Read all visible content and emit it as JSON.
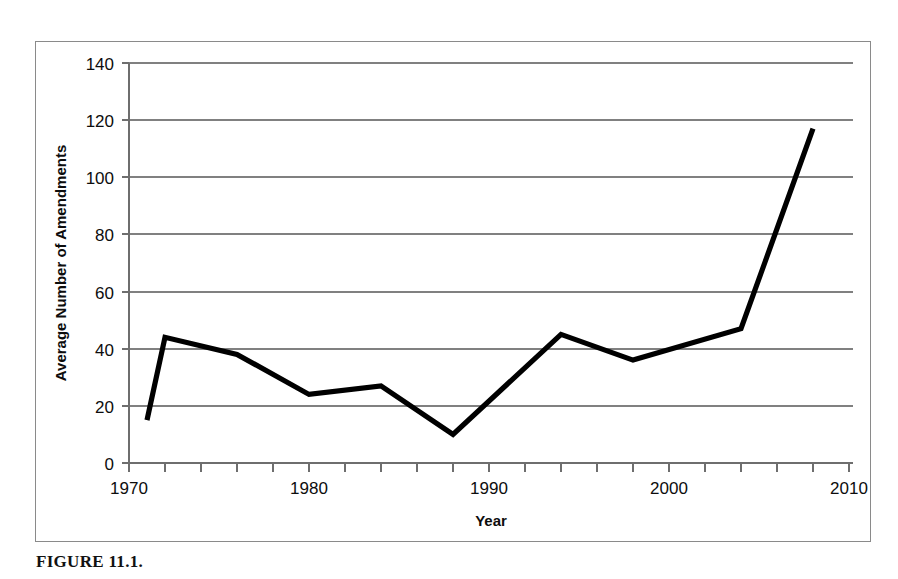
{
  "figure": {
    "caption": "FIGURE 11.1."
  },
  "chart_data": {
    "type": "line",
    "title": "",
    "xlabel": "Year",
    "ylabel": "Average Number of Amendments",
    "xlim": [
      1970,
      2010
    ],
    "ylim": [
      0,
      140
    ],
    "xticks": [
      1970,
      1980,
      1990,
      2000,
      2010
    ],
    "xtick_labels": [
      "1970",
      "1980",
      "1990",
      "2000",
      "2010"
    ],
    "xtick_minor_step": 2,
    "yticks": [
      0,
      20,
      40,
      60,
      80,
      100,
      120,
      140
    ],
    "ytick_labels": [
      "0",
      "20",
      "40",
      "60",
      "80",
      "100",
      "120",
      "140"
    ],
    "grid": "horizontal",
    "legend": "none",
    "line_color": "#000000",
    "series": [
      {
        "name": "Average Number of Amendments",
        "x": [
          1971,
          1972,
          1976,
          1980,
          1984,
          1988,
          1994,
          1998,
          2004,
          2008
        ],
        "values": [
          15,
          44,
          38,
          24,
          27,
          10,
          45,
          36,
          47,
          117
        ]
      }
    ]
  }
}
